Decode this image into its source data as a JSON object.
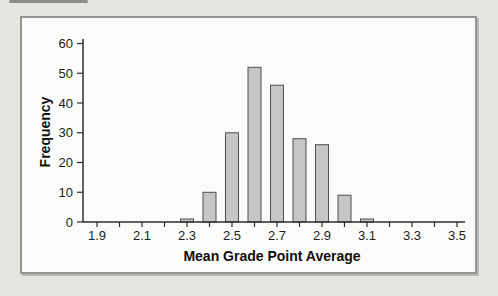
{
  "figure": {
    "type": "histogram-figure",
    "frame_border_color": "#949494",
    "frame_background": "#fbfbf9",
    "page_background": "#e5e6e2"
  },
  "chart_data": {
    "type": "bar",
    "title": "",
    "xlabel": "Mean Grade Point Average",
    "ylabel": "Frequency",
    "categories": [
      2.3,
      2.4,
      2.5,
      2.6,
      2.7,
      2.8,
      2.9,
      3.0,
      3.1
    ],
    "values": [
      1,
      10,
      30,
      52,
      46,
      28,
      26,
      9,
      1
    ],
    "xlim": [
      1.85,
      3.58
    ],
    "ylim": [
      0,
      60
    ],
    "x_minor_ticks": [
      1.9,
      2.0,
      2.1,
      2.2,
      2.3,
      2.4,
      2.5,
      2.6,
      2.7,
      2.8,
      2.9,
      3.0,
      3.1,
      3.2,
      3.3,
      3.4,
      3.5
    ],
    "x_tick_labels": [
      "1.9",
      "2.1",
      "2.3",
      "2.5",
      "2.7",
      "2.9",
      "3.1",
      "3.3",
      "3.5"
    ],
    "x_label_positions": [
      1.9,
      2.1,
      2.3,
      2.5,
      2.7,
      2.9,
      3.1,
      3.3,
      3.5
    ],
    "y_ticks": [
      0,
      10,
      20,
      30,
      40,
      50,
      60
    ],
    "grid": false,
    "legend": null,
    "bar_color": "#c6c6c6",
    "bar_edge_color": "#4f4f4f",
    "axis_color": "#2e2e2e",
    "text_color": "#1c1c1c"
  }
}
